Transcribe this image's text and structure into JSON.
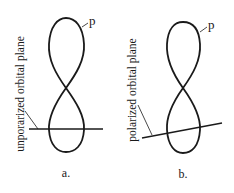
{
  "colors": {
    "stroke": "#1a1a1a",
    "background": "#ffffff"
  },
  "panels": [
    {
      "id": "a",
      "orbital_label": "p",
      "plane_label": "unporarized orbital plane",
      "caption": "a."
    },
    {
      "id": "b",
      "orbital_label": "p",
      "plane_label": "polarized orbital plane",
      "caption": "b."
    }
  ]
}
